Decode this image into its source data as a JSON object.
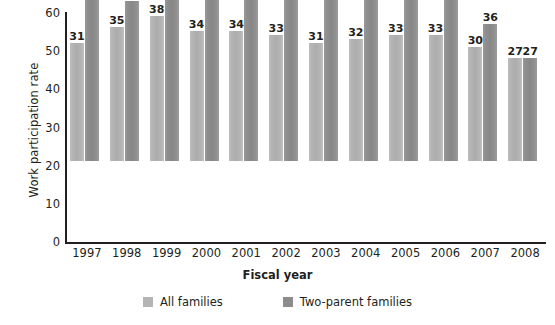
{
  "chart_data": {
    "type": "bar",
    "title": "",
    "xlabel": "Fiscal year",
    "ylabel": "Work participation rate",
    "categories": [
      "1997",
      "1998",
      "1999",
      "2000",
      "2001",
      "2002",
      "2003",
      "2004",
      "2005",
      "2006",
      "2007",
      "2008"
    ],
    "series": [
      {
        "name": "All families",
        "color": "#b4b4b4",
        "values": [
          31,
          35,
          38,
          34,
          34,
          33,
          31,
          32,
          33,
          33,
          30,
          27
        ]
      },
      {
        "name": "Two-parent families",
        "color": "#8c8c8c",
        "values": [
          45,
          42,
          55,
          49,
          51,
          49,
          49,
          47,
          43,
          46,
          36,
          27
        ]
      }
    ],
    "ylim": [
      0,
      60
    ],
    "yticks": [
      "0",
      "10",
      "20",
      "30",
      "40",
      "50",
      "60"
    ],
    "ytick_values": [
      0,
      10,
      20,
      30,
      40,
      50,
      60
    ],
    "grid": false,
    "legend_position": "bottom",
    "data_labels": true,
    "axis_color": "#231f20"
  }
}
